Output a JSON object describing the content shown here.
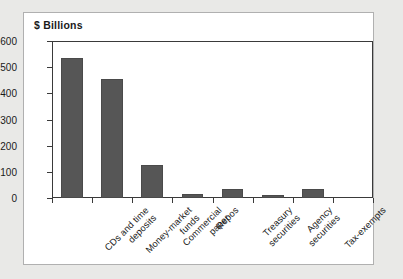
{
  "panel": {
    "background_color": "#ffffff",
    "border_color": "#b0b0b0",
    "page_background_color": "#e9e9e7"
  },
  "chart_data": {
    "type": "bar",
    "title": "$ Billions",
    "xlabel": "",
    "ylabel": "",
    "ylim": [
      0,
      600
    ],
    "grid": false,
    "legend": "none",
    "bar_color": "#565656",
    "axis_color": "#3a3a3a",
    "ytick_labels": [
      "600",
      "500",
      "400",
      "300",
      "200",
      "100",
      "0"
    ],
    "ytick_values": [
      600,
      500,
      400,
      300,
      200,
      100,
      0
    ],
    "categories": [
      "CDs and time deposits",
      "Money-market funds",
      "Commercial paper",
      "Repos",
      "Treasury securities",
      "Agency securities",
      "Tax-exempts"
    ],
    "category_lines": [
      [
        "CDs and time",
        "deposits"
      ],
      [
        "Money-market",
        "funds"
      ],
      [
        "Commercial",
        "paper"
      ],
      [
        "Repos",
        ""
      ],
      [
        "Treasury",
        "securities"
      ],
      [
        "Agency",
        "securities"
      ],
      [
        "Tax-exempts",
        ""
      ]
    ],
    "values": [
      535,
      455,
      125,
      15,
      35,
      12,
      33
    ]
  }
}
